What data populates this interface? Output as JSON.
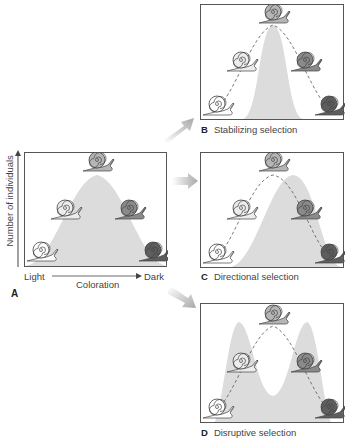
{
  "panel_a": {
    "letter": "A",
    "y_axis_label": "Number of individuals",
    "x_axis_left": "Light",
    "x_axis_center": "Coloration",
    "x_axis_right": "Dark"
  },
  "panel_b": {
    "letter": "B",
    "caption": "Stabilizing selection"
  },
  "panel_c": {
    "letter": "C",
    "caption": "Directional selection"
  },
  "panel_d": {
    "letter": "D",
    "caption": "Disruptive selection"
  },
  "snail_shades": [
    "#ffffff",
    "#ececec",
    "#b5b5b5",
    "#8a8a8a",
    "#5e5e5e"
  ],
  "colors": {
    "curve_fill": "#dcdcdc",
    "arrow": "#b0b0b0",
    "border": "#555555"
  }
}
